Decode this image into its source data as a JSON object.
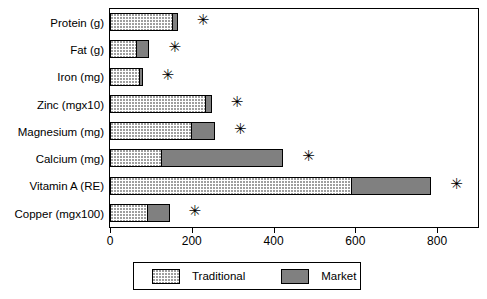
{
  "chart_data": {
    "type": "bar",
    "orientation": "horizontal",
    "stacked": true,
    "title": "",
    "subtitle": "",
    "xlabel": "",
    "ylabel": "",
    "xlim": [
      0,
      900
    ],
    "xticks": [
      0,
      200,
      400,
      600,
      800
    ],
    "xtick_labels": [
      "0",
      "200",
      "400",
      "600",
      "800"
    ],
    "grid": false,
    "legend_position": "bottom",
    "categories": [
      "Protein (g)",
      "Fat (g)",
      "Iron (mg)",
      "Zinc (mgx10)",
      "Magnesium (mg)",
      "Calcium (mg)",
      "Vitamin A (RE)",
      "Copper (mgx100)"
    ],
    "series": [
      {
        "name": "Traditional",
        "color": "#f2f2f2",
        "pattern": "dotted",
        "values": [
          153,
          67,
          74,
          236,
          200,
          126,
          591,
          94
        ]
      },
      {
        "name": "Market",
        "color": "#808080",
        "pattern": "solid",
        "values": [
          15,
          32,
          8,
          15,
          59,
          300,
          197,
          54
        ]
      }
    ],
    "totals": [
      168,
      99,
      82,
      251,
      259,
      426,
      788,
      148
    ],
    "annotations": {
      "symbol": "✳",
      "marked_categories": [
        "Protein (g)",
        "Fat (g)",
        "Iron (mg)",
        "Zinc (mgx10)",
        "Magnesium (mg)",
        "Calcium (mg)",
        "Vitamin A (RE)",
        "Copper (mgx100)"
      ]
    }
  },
  "legend": {
    "items": [
      {
        "label": "Traditional",
        "swatch": "traditional-swatch"
      },
      {
        "label": "Market",
        "swatch": "market-swatch"
      }
    ]
  }
}
